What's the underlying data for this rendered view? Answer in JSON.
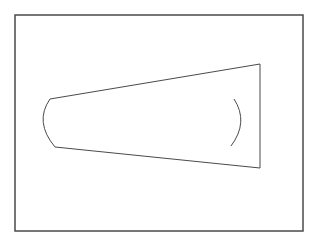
{
  "diagram": {
    "type": "geometric-line-drawing",
    "background": "#ffffff",
    "stroke_color": "#4a4a4a",
    "frame": {
      "x": 15,
      "y": 15,
      "width": 288,
      "height": 216,
      "stroke_width": 1.5
    },
    "shape": {
      "description": "tapered quadrilateral with curved left end and an inner arc near the right end",
      "top_edge": {
        "x1": 50,
        "y1": 99,
        "x2": 260,
        "y2": 64
      },
      "right_edge": {
        "x1": 260,
        "y1": 64,
        "x2": 260,
        "y2": 168
      },
      "bottom_edge": {
        "x1": 260,
        "y1": 168,
        "x2": 55,
        "y2": 147
      },
      "left_arc": {
        "start": [
          50,
          99
        ],
        "control": [
          34,
          122
        ],
        "end": [
          55,
          147
        ]
      },
      "inner_arc": {
        "start": [
          234,
          99
        ],
        "control": [
          249,
          122
        ],
        "end": [
          231,
          146
        ]
      }
    }
  }
}
